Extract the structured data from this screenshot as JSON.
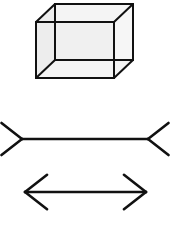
{
  "canvas": {
    "width": 170,
    "height": 229,
    "background_color": "#ffffff"
  },
  "figure_set": {
    "title": "Visual illusion figures",
    "stroke_color": "#111111",
    "figure_count": 3
  },
  "figures": [
    {
      "id": "necker-cube",
      "name": "Necker cube",
      "type": "wireframe-cube",
      "stroke_color": "#111111",
      "stroke_width": 2.0,
      "face_fill": "#f2f2f2",
      "vertices": {
        "front_top_left": [
          36,
          22
        ],
        "front_top_right": [
          114,
          22
        ],
        "front_bottom_left": [
          36,
          78
        ],
        "front_bottom_right": [
          114,
          78
        ],
        "back_top_left": [
          55,
          4
        ],
        "back_top_right": [
          133,
          4
        ],
        "back_bottom_left": [
          55,
          60
        ],
        "back_bottom_right": [
          133,
          60
        ]
      },
      "offset": [
        19,
        -18
      ]
    },
    {
      "id": "muller-lyer-fins-out",
      "name": "Muller-Lyer figure with outward fins",
      "type": "muller-lyer",
      "fin_direction": "outward",
      "stroke_color": "#111111",
      "stroke_width": 2.6,
      "shaft": {
        "x1": 22,
        "y1": 139,
        "x2": 148,
        "y2": 139
      },
      "fin_length": 26,
      "fin_angle_degrees": 38
    },
    {
      "id": "muller-lyer-fins-in",
      "name": "Muller-Lyer figure with inward fins",
      "type": "muller-lyer",
      "fin_direction": "inward",
      "stroke_color": "#111111",
      "stroke_width": 2.6,
      "shaft": {
        "x1": 25,
        "y1": 192,
        "x2": 146,
        "y2": 192
      },
      "fin_length": 28,
      "fin_angle_degrees": 38
    }
  ]
}
